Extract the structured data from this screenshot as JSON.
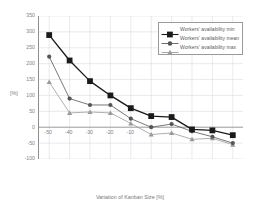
{
  "chart_data": {
    "type": "line",
    "title": "",
    "subtitle": "",
    "xlabel": "Variation of Kanban Size [%]",
    "ylabel": "[%]",
    "x": [
      -50,
      -40,
      -30,
      -20,
      -10,
      0,
      10,
      20,
      30,
      40
    ],
    "categories": [
      "-50",
      "-40",
      "-30",
      "-20",
      "-10",
      "",
      "",
      "",
      "",
      ""
    ],
    "xtick_labels": [
      "-50",
      "-40",
      "-30",
      "-20",
      "-10"
    ],
    "xtick_values": [
      -50,
      -40,
      -30,
      -20,
      -10
    ],
    "ytick_labels": [
      "350",
      "300",
      "250",
      "200",
      "150",
      "100",
      "50",
      "0",
      "-50",
      "-100"
    ],
    "ytick_values": [
      350,
      300,
      250,
      200,
      150,
      100,
      50,
      0,
      -50,
      -100
    ],
    "xlim": [
      -55,
      45
    ],
    "ylim": [
      -100,
      350
    ],
    "grid": true,
    "grid_color": "#d8dce4",
    "legend_position": "top-right",
    "series": [
      {
        "name": "Workers' availability min",
        "marker": "square",
        "color": "#1a1a1a",
        "values": [
          290,
          210,
          145,
          100,
          60,
          35,
          32,
          -7,
          -10,
          -25
        ]
      },
      {
        "name": "Workers' availability mean",
        "marker": "circle",
        "color": "#555555",
        "values": [
          222,
          90,
          70,
          70,
          27,
          0,
          10,
          -13,
          -30,
          -50
        ]
      },
      {
        "name": "Workers' availability max",
        "marker": "triangle",
        "color": "#9a9a9a",
        "values": [
          142,
          45,
          48,
          45,
          12,
          -23,
          -18,
          -38,
          -35,
          -55
        ]
      }
    ]
  },
  "legend": {
    "entries": [
      {
        "label": "Workers' availability min"
      },
      {
        "label": "Workers' availability mean"
      },
      {
        "label": "Workers' availability max"
      }
    ]
  },
  "axes": {
    "x_title": "Variation of Kanban Size [%]",
    "y_title": "[%]"
  },
  "colors": {
    "min_series": "#1a1a1a",
    "mean_series": "#555555",
    "max_series": "#9a9a9a",
    "grid": "#d8dce4",
    "axis": "#8e8e8e",
    "text": "#838383",
    "background": "#ffffff"
  }
}
